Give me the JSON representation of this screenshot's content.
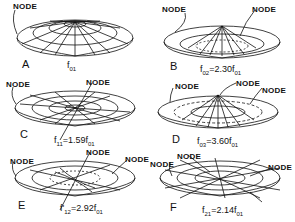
{
  "figure": {
    "panels": [
      {
        "id": "A",
        "letter": "A",
        "freq_main": "f",
        "freq_sub": "01",
        "freq_rest": "",
        "node_labels": [
          "NODE"
        ]
      },
      {
        "id": "B",
        "letter": "B",
        "freq_main": "f",
        "freq_sub": "02",
        "freq_rest": "=2.30f",
        "freq_rest_sub": "01",
        "node_labels": [
          "NODE",
          "NODE"
        ]
      },
      {
        "id": "C",
        "letter": "C",
        "freq_main": "f",
        "freq_sub": "11",
        "freq_rest": "=1.59f",
        "freq_rest_sub": "01",
        "node_labels": [
          "NODE",
          "NODE"
        ]
      },
      {
        "id": "D",
        "letter": "D",
        "freq_main": "f",
        "freq_sub": "03",
        "freq_rest": "=3.60f",
        "freq_rest_sub": "01",
        "node_labels": [
          "NODE",
          "NODE",
          "NODE"
        ]
      },
      {
        "id": "E",
        "letter": "E",
        "freq_main": "f'",
        "freq_sub": "12",
        "freq_rest": "=2.92f",
        "freq_rest_sub": "01",
        "node_labels": [
          "NODE",
          "NODE",
          "NODE"
        ]
      },
      {
        "id": "F",
        "letter": "F",
        "freq_main": "f",
        "freq_sub": "21",
        "freq_rest": "=2.14f",
        "freq_rest_sub": "01",
        "node_labels": [
          "NODE",
          "NODE",
          "NODE"
        ]
      }
    ]
  }
}
